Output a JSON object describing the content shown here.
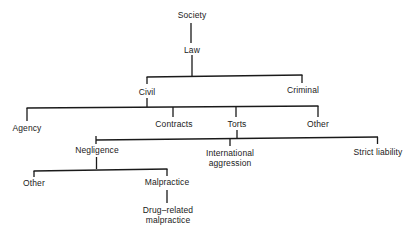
{
  "diagram": {
    "type": "tree",
    "title": "",
    "nodes": {
      "society": "Society",
      "law": "Law",
      "civil": "Civil",
      "criminal": "Criminal",
      "agency": "Agency",
      "contracts": "Contracts",
      "torts": "Torts",
      "civil_other": "Other",
      "negligence": "Negligence",
      "international_aggression": [
        "International",
        "aggression"
      ],
      "strict_liability": "Strict liability",
      "negligence_other": "Other",
      "malpractice": "Malpractice",
      "drug_related_malpractice": [
        "Drug–related",
        "malpractice"
      ]
    },
    "edges": [
      [
        "Society",
        "Law"
      ],
      [
        "Law",
        "Civil"
      ],
      [
        "Law",
        "Criminal"
      ],
      [
        "Civil",
        "Agency"
      ],
      [
        "Civil",
        "Contracts"
      ],
      [
        "Civil",
        "Torts"
      ],
      [
        "Civil",
        "Other"
      ],
      [
        "Torts",
        "Negligence"
      ],
      [
        "Torts",
        "International aggression"
      ],
      [
        "Torts",
        "Strict liability"
      ],
      [
        "Negligence",
        "Other"
      ],
      [
        "Negligence",
        "Malpractice"
      ],
      [
        "Malpractice",
        "Drug-related malpractice"
      ]
    ],
    "line_color": "#1a1a1a",
    "background": "#ffffff"
  }
}
